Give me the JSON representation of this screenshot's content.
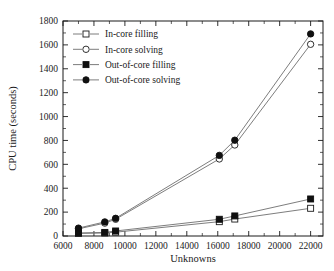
{
  "chart_data": {
    "type": "line",
    "title": "",
    "xlabel": "Unknowns",
    "ylabel": "CPU time (seconds)",
    "xlim": [
      6000,
      22800
    ],
    "ylim": [
      0,
      1800
    ],
    "xticks": [
      6000,
      8000,
      10000,
      12000,
      14000,
      16000,
      18000,
      20000,
      22000
    ],
    "xtick_labels": [
      "6000",
      "8000",
      "10000",
      "12000",
      "14000",
      "16000",
      "18000",
      "20000",
      "22000"
    ],
    "yticks": [
      0,
      200,
      400,
      600,
      800,
      1000,
      1200,
      1400,
      1600,
      1800
    ],
    "ytick_labels": [
      "0",
      "200",
      "400",
      "600",
      "800",
      "1000",
      "1200",
      "1400",
      "1600",
      "1800"
    ],
    "grid": false,
    "legend_position": "upper-left",
    "series": [
      {
        "name": "In-core filling",
        "marker": "open-square",
        "x": [
          7000,
          8700,
          9400,
          16100,
          17100,
          22000
        ],
        "values": [
          22,
          25,
          32,
          120,
          142,
          232
        ]
      },
      {
        "name": "In-core solving",
        "marker": "open-circle",
        "x": [
          7000,
          8700,
          9400,
          16100,
          17100,
          22000
        ],
        "values": [
          60,
          108,
          140,
          645,
          762,
          1605
        ]
      },
      {
        "name": "Out-of-core filling",
        "marker": "filled-square",
        "x": [
          7000,
          8700,
          9400,
          16100,
          17100,
          22000
        ],
        "values": [
          25,
          30,
          42,
          140,
          168,
          310
        ]
      },
      {
        "name": "Out-of-core solving",
        "marker": "filled-circle",
        "x": [
          7000,
          8700,
          9400,
          16100,
          17100,
          22000
        ],
        "values": [
          66,
          118,
          148,
          675,
          802,
          1692
        ]
      }
    ]
  },
  "legend": {
    "entries": [
      {
        "label": "In-core filling",
        "marker": "open-square"
      },
      {
        "label": "In-core solving",
        "marker": "open-circle"
      },
      {
        "label": "Out-of-core filling",
        "marker": "filled-square"
      },
      {
        "label": "Out-of-core solving",
        "marker": "filled-circle"
      }
    ]
  },
  "colors": {
    "axis": "#1a1a1a",
    "line": "#6e6e6e",
    "marker_fill": "#101010",
    "marker_open": "#ffffff",
    "background": "#ffffff"
  }
}
